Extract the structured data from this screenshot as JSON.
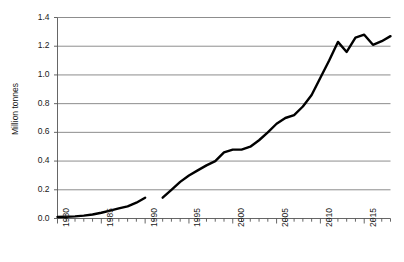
{
  "chart_data": {
    "type": "line",
    "title": "",
    "xlabel": "",
    "ylabel": "Million tonnes",
    "xlim": [
      1980,
      2018
    ],
    "ylim": [
      0.0,
      1.4
    ],
    "grid": "horizontal",
    "legend": "none",
    "line_color": "#000000",
    "background_color": "#ffffff",
    "gridline_color": "#808080",
    "y_ticks": [
      "0.0",
      "0.2",
      "0.4",
      "0.6",
      "0.8",
      "1.0",
      "1.2",
      "1.4"
    ],
    "y_tick_values": [
      0.0,
      0.2,
      0.4,
      0.6,
      0.8,
      1.0,
      1.2,
      1.4
    ],
    "x_ticks": [
      "1980",
      "1985",
      "1990",
      "1995",
      "2000",
      "2005",
      "2010",
      "2015"
    ],
    "x_tick_values": [
      1980,
      1985,
      1990,
      1995,
      2000,
      2005,
      2010,
      2015
    ],
    "x_minor_tick_interval": 1,
    "series": [
      {
        "name": "Production",
        "note": "data gap between 1990 and 1992",
        "x": [
          1980,
          1981,
          1982,
          1983,
          1984,
          1985,
          1986,
          1987,
          1988,
          1989,
          1990
        ],
        "values": [
          0.01,
          0.012,
          0.015,
          0.02,
          0.028,
          0.04,
          0.055,
          0.07,
          0.085,
          0.11,
          0.145
        ]
      },
      {
        "name": "Production (cont.)",
        "x": [
          1992,
          1993,
          1994,
          1995,
          1996,
          1997,
          1998,
          1999,
          2000,
          2001,
          2002,
          2003,
          2004,
          2005,
          2006,
          2007,
          2008,
          2009,
          2010,
          2011,
          2012,
          2013,
          2014,
          2015,
          2016,
          2017,
          2018
        ],
        "values": [
          0.145,
          0.2,
          0.255,
          0.3,
          0.335,
          0.37,
          0.4,
          0.46,
          0.48,
          0.48,
          0.5,
          0.545,
          0.6,
          0.66,
          0.7,
          0.72,
          0.78,
          0.86,
          0.98,
          1.1,
          1.23,
          1.16,
          1.26,
          1.28,
          1.21,
          1.235,
          1.27
        ]
      }
    ]
  }
}
